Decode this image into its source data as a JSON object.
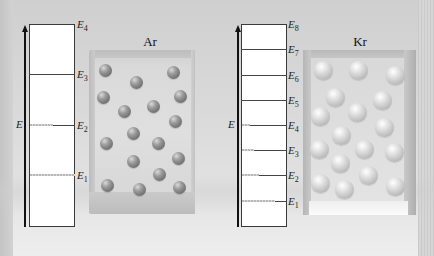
{
  "panels": [
    {
      "element": "Ar",
      "axis_label": "E",
      "levels": [
        {
          "label": "E",
          "sub": "4",
          "dashed_fraction": 0
        },
        {
          "label": "E",
          "sub": "3",
          "dashed_fraction": 0
        },
        {
          "label": "E",
          "sub": "2",
          "dashed_fraction": 0.5
        },
        {
          "label": "E",
          "sub": "1",
          "dashed_fraction": 1.0
        }
      ],
      "atom_count": 18
    },
    {
      "element": "Kr",
      "axis_label": "E",
      "levels": [
        {
          "label": "E",
          "sub": "8",
          "dashed_fraction": 0
        },
        {
          "label": "E",
          "sub": "7",
          "dashed_fraction": 0
        },
        {
          "label": "E",
          "sub": "6",
          "dashed_fraction": 0
        },
        {
          "label": "E",
          "sub": "5",
          "dashed_fraction": 0
        },
        {
          "label": "E",
          "sub": "4",
          "dashed_fraction": 0.2
        },
        {
          "label": "E",
          "sub": "3",
          "dashed_fraction": 0.3
        },
        {
          "label": "E",
          "sub": "2",
          "dashed_fraction": 0.4
        },
        {
          "label": "E",
          "sub": "1",
          "dashed_fraction": 0.75
        }
      ],
      "atom_count": 18
    }
  ],
  "colors": {
    "background": "#dadada",
    "ar_atom": "#8a8a8a",
    "kr_atom": "#d5d5d5",
    "level_line": "#444444",
    "populated_level": "#b8b8b8"
  }
}
